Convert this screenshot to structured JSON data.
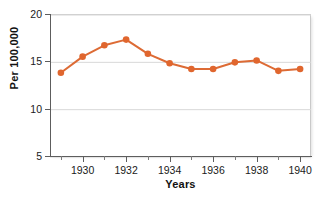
{
  "chart_data": {
    "type": "line",
    "title": "",
    "xlabel": "Years",
    "ylabel": "Per 100,000",
    "x": [
      1929,
      1930,
      1931,
      1932,
      1933,
      1934,
      1935,
      1936,
      1937,
      1938,
      1939,
      1940
    ],
    "values": [
      13.9,
      15.6,
      16.8,
      17.4,
      15.9,
      14.9,
      14.3,
      14.3,
      15.0,
      15.2,
      14.1,
      14.3
    ],
    "series": [
      {
        "name": "Rate per 100,000",
        "values": [
          13.9,
          15.6,
          16.8,
          17.4,
          15.9,
          14.9,
          14.3,
          14.3,
          15.0,
          15.2,
          14.1,
          14.3
        ],
        "color": "#dd6b35"
      }
    ],
    "xlim": [
      1928.5,
      1940.5
    ],
    "ylim": [
      5,
      20
    ],
    "y_ticks": [
      5,
      10,
      15,
      20
    ],
    "y_tick_labels": [
      "5",
      "10",
      "15",
      "20"
    ],
    "x_ticks_major": [
      1930,
      1932,
      1934,
      1936,
      1938,
      1940
    ],
    "x_tick_labels": [
      "1930",
      "1932",
      "1934",
      "1936",
      "1938",
      "1940"
    ],
    "x_ticks_minor": [
      1929,
      1931,
      1933,
      1935,
      1937,
      1939
    ],
    "grid": "horizontal",
    "legend": "none",
    "marker": "circle",
    "colors": {
      "line": "#dd6b35",
      "marker": "#e0662e",
      "grid": "#d8d8d8",
      "axis": "#5d5d5d",
      "text": "#111111",
      "background": "#ffffff"
    }
  }
}
